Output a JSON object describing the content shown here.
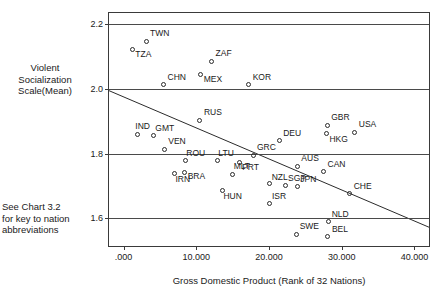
{
  "chart_data": {
    "type": "scatter",
    "title": "",
    "xlabel": "Gross Domestic Product (Rank of 32 Nations)",
    "ylabel": "Violent\nSocialization\nScale(Mean)",
    "note": "See Chart 3.2\nfor key to nation\nabbreviations",
    "xlim": [
      -2000,
      42000
    ],
    "ylim": [
      1.515,
      2.235
    ],
    "xticks": [
      {
        "value": 0,
        "label": ".000"
      },
      {
        "value": 10000,
        "label": "10.000"
      },
      {
        "value": 20000,
        "label": "20.000"
      },
      {
        "value": 30000,
        "label": "30.000"
      },
      {
        "value": 40000,
        "label": "40.000"
      }
    ],
    "yticks": [
      {
        "value": 2.2,
        "label": "2.2"
      },
      {
        "value": 2.0,
        "label": "2.0"
      },
      {
        "value": 1.8,
        "label": "1.8"
      },
      {
        "value": 1.6,
        "label": "1.6"
      }
    ],
    "grid": true,
    "legend": "none",
    "trend_line": {
      "x0": -2000,
      "y0": 1.995,
      "x1": 42000,
      "y1": 1.573
    },
    "points": [
      {
        "label": "TWN",
        "x": 3100,
        "y": 2.148,
        "lx": 4,
        "ly": -12
      },
      {
        "label": "TZA",
        "x": 1200,
        "y": 2.123,
        "lx": 3,
        "ly": 1
      },
      {
        "label": "ZAF",
        "x": 12100,
        "y": 2.086,
        "lx": 4,
        "ly": -12
      },
      {
        "label": "MEX",
        "x": 10600,
        "y": 2.046,
        "lx": 3,
        "ly": 1
      },
      {
        "label": "CHN",
        "x": 5500,
        "y": 2.014,
        "lx": 4,
        "ly": -12
      },
      {
        "label": "KOR",
        "x": 17200,
        "y": 2.014,
        "lx": 4,
        "ly": -12
      },
      {
        "label": "RUS",
        "x": 10500,
        "y": 1.903,
        "lx": 4,
        "ly": -12
      },
      {
        "label": "GBR",
        "x": 28000,
        "y": 1.888,
        "lx": 4,
        "ly": -12
      },
      {
        "label": "USA",
        "x": 31800,
        "y": 1.866,
        "lx": 4,
        "ly": -12
      },
      {
        "label": "IND",
        "x": 1900,
        "y": 1.86,
        "lx": -2,
        "ly": -12
      },
      {
        "label": "GMT",
        "x": 4100,
        "y": 1.855,
        "lx": 2,
        "ly": -12
      },
      {
        "label": "HKG",
        "x": 27900,
        "y": 1.862,
        "lx": 3,
        "ly": 1
      },
      {
        "label": "DEU",
        "x": 21400,
        "y": 1.84,
        "lx": 4,
        "ly": -12
      },
      {
        "label": "VEN",
        "x": 5600,
        "y": 1.814,
        "lx": 4,
        "ly": -12
      },
      {
        "label": "GRC",
        "x": 17800,
        "y": 1.795,
        "lx": 4,
        "ly": -12
      },
      {
        "label": "ROU",
        "x": 8500,
        "y": 1.778,
        "lx": 1,
        "ly": -12
      },
      {
        "label": "LTU",
        "x": 12900,
        "y": 1.778,
        "lx": 1,
        "ly": -12
      },
      {
        "label": "PRT",
        "x": 15900,
        "y": 1.774,
        "lx": 3,
        "ly": 1
      },
      {
        "label": "AUS",
        "x": 23900,
        "y": 1.762,
        "lx": 4,
        "ly": -12
      },
      {
        "label": "CAN",
        "x": 27500,
        "y": 1.744,
        "lx": 4,
        "ly": -12
      },
      {
        "label": "IRN",
        "x": 7000,
        "y": 1.738,
        "lx": 1,
        "ly": 1
      },
      {
        "label": "BRA",
        "x": 8400,
        "y": 1.742,
        "lx": 3,
        "ly": -1
      },
      {
        "label": "MLT",
        "x": 15000,
        "y": 1.736,
        "lx": 1,
        "ly": -12
      },
      {
        "label": "NZL",
        "x": 20100,
        "y": 1.708,
        "lx": 2,
        "ly": -11
      },
      {
        "label": "SGP",
        "x": 22200,
        "y": 1.702,
        "lx": 3,
        "ly": -11
      },
      {
        "label": "JPN",
        "x": 23900,
        "y": 1.699,
        "lx": 3,
        "ly": -11
      },
      {
        "label": "CHE",
        "x": 31100,
        "y": 1.677,
        "lx": 4,
        "ly": -12
      },
      {
        "label": "HUN",
        "x": 13600,
        "y": 1.687,
        "lx": 1,
        "ly": 2
      },
      {
        "label": "ISR",
        "x": 20000,
        "y": 1.645,
        "lx": 3,
        "ly": -12
      },
      {
        "label": "NLD",
        "x": 28200,
        "y": 1.59,
        "lx": 3,
        "ly": -12
      },
      {
        "label": "SWE",
        "x": 23800,
        "y": 1.552,
        "lx": 3,
        "ly": -12
      },
      {
        "label": "BEL",
        "x": 28100,
        "y": 1.543,
        "lx": 4,
        "ly": -12
      }
    ]
  }
}
